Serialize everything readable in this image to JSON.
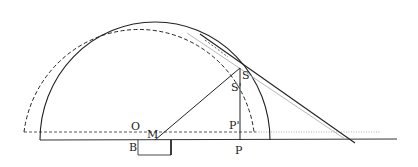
{
  "diagram": {
    "type": "geometric construction",
    "labels": {
      "O": "O",
      "M": "M",
      "B": "B",
      "S": "S",
      "S_prime": "S'",
      "P": "P",
      "P_prime": "P'"
    },
    "colors": {
      "line": "#222222",
      "light_line": "#b0b0b0",
      "background": "#ffffff"
    }
  }
}
